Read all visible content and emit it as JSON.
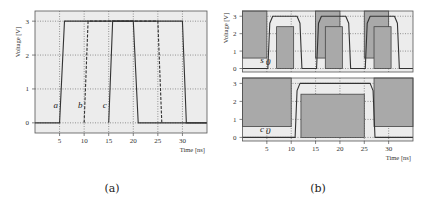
{
  "chart_data": [
    {
      "id": "a",
      "type": "line",
      "caption": "(a)",
      "xlabel": "Time [ns]",
      "ylabel": "Voltage [V]",
      "xlim": [
        0,
        35
      ],
      "ylim": [
        -0.3,
        3.3
      ],
      "xticks": [
        5,
        10,
        15,
        20,
        25,
        30
      ],
      "yticks": [
        0,
        1,
        2,
        3
      ],
      "grid": true,
      "series": [
        {
          "name": "a",
          "style": "solid",
          "x": [
            0,
            5,
            6,
            20,
            21,
            35
          ],
          "y": [
            0,
            0,
            3,
            3,
            0,
            0
          ]
        },
        {
          "name": "b",
          "style": "dashed",
          "x": [
            10,
            10.8,
            25,
            25.8
          ],
          "y": [
            0,
            3,
            3,
            0
          ]
        },
        {
          "name": "c",
          "style": "solid",
          "x": [
            15,
            15.8,
            30,
            30.8,
            35
          ],
          "y": [
            0,
            3,
            3,
            0,
            0
          ]
        }
      ],
      "annotations": [
        {
          "text": "a",
          "x": 4.2,
          "y": 0.45
        },
        {
          "text": "b",
          "x": 9.2,
          "y": 0.45
        },
        {
          "text": "c",
          "x": 14.2,
          "y": 0.45
        }
      ]
    },
    {
      "id": "b",
      "type": "area",
      "caption": "(b)",
      "xlabel": "Time [ns]",
      "ylabel": "Voltage [V]",
      "xlim": [
        0,
        35
      ],
      "xticks": [
        5,
        10,
        15,
        20,
        25,
        30
      ],
      "yticks": [
        0,
        1,
        2,
        3
      ],
      "grid": true,
      "panels": [
        {
          "name": "s0",
          "label": "s0",
          "ylim": [
            -0.2,
            3.3
          ],
          "forbidden_high": [
            [
              0,
              5
            ],
            [
              15,
              20
            ],
            [
              25,
              30
            ],
            [
              35,
              35
            ]
          ],
          "forbidden_low": [
            [
              7,
              10.5
            ],
            [
              17,
              20.5
            ],
            [
              27,
              30.5
            ]
          ],
          "high_region_bottom": 0.6,
          "low_region_top": 2.4,
          "signal": {
            "x": [
              0,
              5.2,
              5.6,
              6.2,
              11.2,
              11.8,
              12.2,
              15.2,
              15.6,
              16.2,
              21.2,
              21.8,
              22.2,
              25.2,
              25.6,
              26.2,
              31.2,
              31.8,
              32.2,
              35
            ],
            "y": [
              0,
              0,
              2.6,
              3,
              3,
              2.6,
              0,
              0,
              2.6,
              3,
              3,
              2.6,
              0,
              0,
              2.6,
              3,
              3,
              2.6,
              0,
              0
            ]
          }
        },
        {
          "name": "c0",
          "label": "c0",
          "ylim": [
            -0.2,
            3.3
          ],
          "forbidden_high": [
            [
              0,
              10
            ],
            [
              27,
              35
            ]
          ],
          "forbidden_low": [
            [
              12,
              25
            ]
          ],
          "high_region_bottom": 0.6,
          "low_region_top": 2.4,
          "signal": {
            "x": [
              0,
              10.8,
              11.2,
              11.8,
              26.2,
              26.8,
              27.2,
              35
            ],
            "y": [
              0,
              0,
              2.6,
              3,
              3,
              2.6,
              0,
              0
            ]
          }
        }
      ]
    }
  ]
}
